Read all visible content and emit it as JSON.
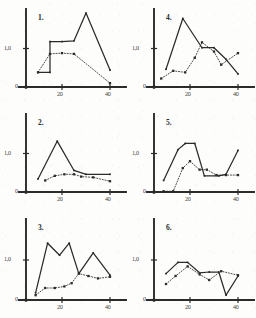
{
  "figure": {
    "background_color": "#fdfdfc",
    "ink_color": "#2b2b2b",
    "panel_count": 6,
    "axis": {
      "y_tick_label": "1,0",
      "zero_label": "0",
      "x_tick_labels": [
        "20",
        "40"
      ],
      "x_tick_values": [
        20,
        40
      ],
      "xlim": [
        5,
        45
      ],
      "ylim": [
        0,
        2.0
      ],
      "y_tick_values": [
        0,
        1.0
      ],
      "grid": false,
      "legend": "none"
    }
  },
  "chart_data": [
    {
      "type": "line",
      "title": "1.",
      "xlabel": "",
      "ylabel": "",
      "xlim": [
        5,
        45
      ],
      "ylim": [
        0,
        2.0
      ],
      "xticks": [
        20,
        40
      ],
      "yticks": [
        0,
        1.0
      ],
      "ytick_labels": [
        "0",
        "1,0"
      ],
      "grid": false,
      "series": [
        {
          "name": "solid",
          "style": "solid",
          "x": [
            10,
            15,
            15,
            20,
            25,
            30,
            40
          ],
          "values": [
            0.38,
            0.38,
            1.18,
            1.18,
            1.2,
            1.92,
            0.44
          ]
        },
        {
          "name": "dotted",
          "style": "dotted",
          "x": [
            10,
            15,
            20,
            25,
            40
          ],
          "values": [
            0.38,
            0.86,
            0.88,
            0.86,
            0.1
          ]
        }
      ]
    },
    {
      "type": "line",
      "title": "4.",
      "xlabel": "",
      "ylabel": "",
      "xlim": [
        5,
        45
      ],
      "ylim": [
        0,
        2.0
      ],
      "xticks": [
        20,
        40
      ],
      "yticks": [
        0,
        1.0
      ],
      "ytick_labels": [
        "0",
        "1,0"
      ],
      "grid": false,
      "series": [
        {
          "name": "solid",
          "style": "solid",
          "x": [
            10,
            17,
            25,
            30,
            35,
            40
          ],
          "values": [
            0.46,
            1.78,
            1.02,
            1.02,
            0.72,
            0.34
          ]
        },
        {
          "name": "dotted",
          "style": "dotted",
          "x": [
            8,
            13,
            18,
            22,
            25,
            30,
            33,
            40
          ],
          "values": [
            0.22,
            0.42,
            0.38,
            0.76,
            1.16,
            0.92,
            0.58,
            0.88
          ]
        }
      ]
    },
    {
      "type": "line",
      "title": "2.",
      "xlabel": "",
      "ylabel": "",
      "xlim": [
        5,
        45
      ],
      "ylim": [
        0,
        2.0
      ],
      "xticks": [
        20,
        40
      ],
      "yticks": [
        0,
        1.0
      ],
      "ytick_labels": [
        "0",
        "1,0"
      ],
      "grid": false,
      "series": [
        {
          "name": "solid",
          "style": "solid",
          "x": [
            10,
            18,
            25,
            30,
            40
          ],
          "values": [
            0.34,
            1.32,
            0.56,
            0.46,
            0.46
          ]
        },
        {
          "name": "dotted",
          "style": "dotted",
          "x": [
            13,
            17,
            21,
            25,
            28,
            33,
            40
          ],
          "values": [
            0.3,
            0.42,
            0.46,
            0.46,
            0.4,
            0.38,
            0.28
          ]
        }
      ]
    },
    {
      "type": "line",
      "title": "5.",
      "xlabel": "",
      "ylabel": "",
      "xlim": [
        5,
        45
      ],
      "ylim": [
        0,
        2.0
      ],
      "xticks": [
        20,
        40
      ],
      "yticks": [
        0,
        1.0
      ],
      "ytick_labels": [
        "0",
        "1,0"
      ],
      "grid": false,
      "series": [
        {
          "name": "solid",
          "style": "solid",
          "x": [
            9,
            15,
            18,
            22,
            26,
            32,
            35,
            40
          ],
          "values": [
            0.3,
            1.1,
            1.26,
            1.26,
            0.42,
            0.42,
            0.46,
            1.08
          ]
        },
        {
          "name": "dotted",
          "style": "dotted",
          "x": [
            9,
            13,
            17,
            20,
            24,
            27,
            31,
            35,
            40
          ],
          "values": [
            0.02,
            0.02,
            0.62,
            0.8,
            0.58,
            0.58,
            0.44,
            0.44,
            0.44
          ]
        }
      ]
    },
    {
      "type": "line",
      "title": "3.",
      "xlabel": "",
      "ylabel": "",
      "xlim": [
        5,
        45
      ],
      "ylim": [
        0,
        2.0
      ],
      "xticks": [
        20,
        40
      ],
      "yticks": [
        0,
        1.0
      ],
      "ytick_labels": [
        "0",
        "1,0"
      ],
      "grid": false,
      "series": [
        {
          "name": "solid",
          "style": "solid",
          "x": [
            9,
            14,
            19,
            23,
            27,
            33,
            40
          ],
          "values": [
            0.18,
            1.42,
            1.12,
            1.42,
            0.66,
            1.18,
            0.62
          ]
        },
        {
          "name": "dotted",
          "style": "dotted",
          "x": [
            9,
            13,
            17,
            21,
            24,
            27,
            31,
            35,
            40
          ],
          "values": [
            0.12,
            0.3,
            0.3,
            0.34,
            0.42,
            0.66,
            0.6,
            0.54,
            0.58
          ]
        }
      ]
    },
    {
      "type": "line",
      "title": "6.",
      "xlabel": "",
      "ylabel": "",
      "xlim": [
        5,
        45
      ],
      "ylim": [
        0,
        2.0
      ],
      "xticks": [
        20,
        40
      ],
      "yticks": [
        0,
        1.0
      ],
      "ytick_labels": [
        "0",
        "1,0"
      ],
      "grid": false,
      "series": [
        {
          "name": "solid",
          "style": "solid",
          "x": [
            10,
            15,
            19,
            24,
            28,
            32,
            35,
            40
          ],
          "values": [
            0.66,
            0.94,
            0.94,
            0.68,
            0.7,
            0.7,
            0.12,
            0.6
          ]
        },
        {
          "name": "dotted",
          "style": "dotted",
          "x": [
            10,
            14,
            19,
            24,
            28,
            33,
            40
          ],
          "values": [
            0.4,
            0.6,
            0.84,
            0.64,
            0.5,
            0.72,
            0.62
          ]
        }
      ]
    }
  ]
}
